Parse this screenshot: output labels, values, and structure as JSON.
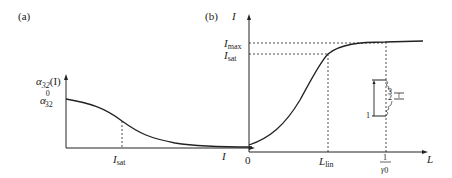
{
  "panel_a": {
    "label": "(a)",
    "y_axis_label": "α32(I)",
    "y_axis": {
      "main": "α",
      "sub": "32",
      "suffix": "(I)"
    },
    "y_intercept": {
      "main": "α",
      "sup": "0",
      "sub": "32"
    },
    "x_axis_label": "I",
    "marker": {
      "main": "I",
      "sub": "sat"
    }
  },
  "panel_b": {
    "label": "(b)",
    "y_axis_label": "I",
    "x_axis_label": "L",
    "origin": "0",
    "levels": [
      {
        "main": "I",
        "sub": "max"
      },
      {
        "main": "I",
        "sub": "sat"
      }
    ],
    "x_markers": [
      {
        "main": "L",
        "sub": "lin"
      },
      {
        "num": "1",
        "den": "γ",
        "den_sub": "0"
      }
    ],
    "inset_levels": [
      "1",
      "2",
      "3"
    ]
  }
}
